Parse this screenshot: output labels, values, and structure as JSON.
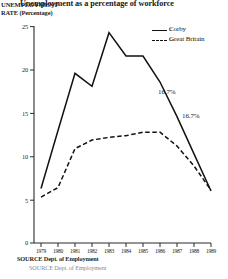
{
  "titles": {
    "main": "Unemployment as a percentage of workforce",
    "axis_line1": "UNEMPLOYMENT",
    "axis_line2": "RATE (Percentage)"
  },
  "legend": {
    "items": [
      {
        "label": "Corby",
        "prefix": "C",
        "style": "solid"
      },
      {
        "label": "Great Britain",
        "prefix": "Gr",
        "style": "dashed"
      }
    ]
  },
  "annotations": [
    {
      "text": "16.7%"
    },
    {
      "text": "16.7%"
    }
  ],
  "source": {
    "line1": "SOURCE Dept. of Employment",
    "line2": "SOURCE Dept. of Employment"
  },
  "chart_data": {
    "type": "line",
    "title": "Unemployment as a percentage of workforce",
    "xlabel": "",
    "ylabel": "UNEMPLOYMENT RATE (Percentage)",
    "ylim": [
      0,
      25
    ],
    "yticks": [
      0,
      5,
      10,
      15,
      20,
      25
    ],
    "ytick_labels": [
      "0",
      "5",
      "10",
      "15",
      "20",
      "25"
    ],
    "x": [
      1979,
      1980,
      1981,
      1982,
      1983,
      1984,
      1985,
      1986,
      1987,
      1988,
      1989
    ],
    "xtick_labels": [
      "1979",
      "1980",
      "1981",
      "1982",
      "1983",
      "1984",
      "1985",
      "1986",
      "1987",
      "1988",
      "1989"
    ],
    "grid": false,
    "legend_position": "upper right",
    "series": [
      {
        "name": "Corby",
        "style": "solid",
        "values": [
          6.3,
          13.0,
          19.6,
          18.1,
          24.3,
          21.6,
          21.6,
          18.6,
          14.6,
          10.3,
          6.0
        ]
      },
      {
        "name": "Great Britain",
        "style": "dashed",
        "values": [
          5.3,
          6.4,
          10.9,
          11.9,
          12.2,
          12.4,
          12.8,
          12.8,
          11.2,
          8.9,
          6.1
        ]
      }
    ],
    "annotations": [
      "16.7%",
      "16.7%"
    ],
    "source": "SOURCE Dept. of Employment"
  }
}
